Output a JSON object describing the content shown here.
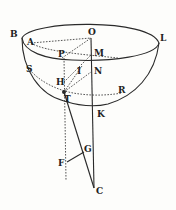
{
  "diagram": {
    "title": "",
    "colors": {
      "ink": "#2a2a2a",
      "background": "#fdfdfb"
    },
    "labels": [
      {
        "id": "B",
        "text": "B",
        "x": 10,
        "y": 30
      },
      {
        "id": "O",
        "text": "O",
        "x": 88,
        "y": 28
      },
      {
        "id": "L",
        "text": "L",
        "x": 160,
        "y": 34
      },
      {
        "id": "A",
        "text": "A",
        "x": 27,
        "y": 38
      },
      {
        "id": "P",
        "text": "P",
        "x": 58,
        "y": 50
      },
      {
        "id": "M",
        "text": "M",
        "x": 94,
        "y": 49
      },
      {
        "id": "S",
        "text": "S",
        "x": 26,
        "y": 65
      },
      {
        "id": "I",
        "text": "I",
        "x": 77,
        "y": 67
      },
      {
        "id": "N",
        "text": "N",
        "x": 94,
        "y": 67
      },
      {
        "id": "H",
        "text": "H",
        "x": 56,
        "y": 78
      },
      {
        "id": "R",
        "text": "R",
        "x": 118,
        "y": 86
      },
      {
        "id": "T",
        "text": "T",
        "x": 64,
        "y": 95
      },
      {
        "id": "K",
        "text": "K",
        "x": 97,
        "y": 110
      },
      {
        "id": "G",
        "text": "G",
        "x": 84,
        "y": 145
      },
      {
        "id": "F",
        "text": "F",
        "x": 58,
        "y": 159
      },
      {
        "id": "C",
        "text": "C",
        "x": 96,
        "y": 187
      }
    ]
  }
}
